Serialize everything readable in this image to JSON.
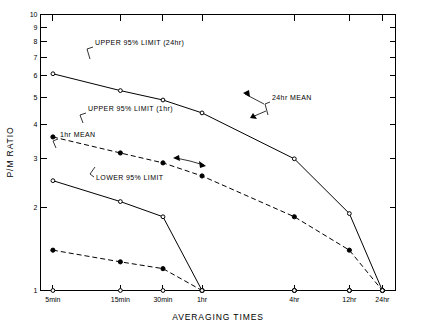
{
  "chart_data": {
    "type": "line",
    "title": "",
    "xlabel": "AVERAGING TIMES",
    "ylabel": "P/M RATIO",
    "yscale": "log",
    "ylim": [
      1,
      10
    ],
    "grid": false,
    "legend_position": "inline-annotations",
    "categories": [
      "5min",
      "15min",
      "30min",
      "1hr",
      "4hr",
      "12hr",
      "24hr"
    ],
    "x_tick_labels": [
      "5min",
      "15min",
      "30min",
      "1hr",
      "4hr",
      "12hr",
      "24hr"
    ],
    "y_tick_labels": [
      "1",
      "2",
      "3",
      "4",
      "5",
      "6",
      "7",
      "8",
      "9",
      "10"
    ],
    "y_tick_values": [
      1,
      2,
      3,
      4,
      5,
      6,
      7,
      8,
      9,
      10
    ],
    "series": [
      {
        "name": "UPPER 95% LIMIT (24hr)",
        "style": "solid",
        "marker": "open-circle",
        "values": [
          6.1,
          5.3,
          4.9,
          4.4,
          3.0,
          1.9,
          1.0
        ]
      },
      {
        "name": "24hr MEAN",
        "style": "dashed",
        "marker": "filled-circle",
        "values": [
          3.6,
          3.15,
          2.9,
          2.6,
          1.85,
          1.4,
          1.0
        ]
      },
      {
        "name": "UPPER 95% LIMIT (1hr)",
        "style": "solid",
        "marker": "open-circle",
        "values": [
          2.5,
          2.1,
          1.85,
          1.0,
          1.0,
          1.0,
          1.0
        ]
      },
      {
        "name": "1hr MEAN",
        "style": "dashed",
        "marker": "filled-circle",
        "values": [
          1.4,
          1.27,
          1.2,
          1.0,
          1.0,
          1.0,
          1.0
        ]
      },
      {
        "name": "LOWER 95% LIMIT",
        "style": "solid",
        "marker": "open-circle",
        "values": [
          1.0,
          1.0,
          1.0,
          1.0,
          1.0,
          1.0,
          1.0
        ]
      }
    ],
    "annotations": [
      {
        "id": "upper-95-24hr",
        "text": "UPPER 95% LIMIT (24hr)",
        "text_x": 95,
        "text_y": 45,
        "leader": "M 93 47 L 87 49 L 90 59"
      },
      {
        "id": "24hr-mean",
        "text": "24hr MEAN",
        "text_x": 272,
        "text_y": 100,
        "leader": "M 270 102 L 265 104 L 268 115"
      },
      {
        "id": "upper-95-1hr",
        "text": "UPPER 95% LIMIT (1hr)",
        "text_x": 88,
        "text_y": 111,
        "leader": "M 86 113 L 80 115 L 83 123"
      },
      {
        "id": "1hr-mean",
        "text": "1hr MEAN",
        "text_x": 60,
        "text_y": 137,
        "leader": "M 58 139 L 53 141 L 56 148"
      },
      {
        "id": "lower-95",
        "text": "LOWER 95% LIMIT",
        "text_x": 96,
        "text_y": 180,
        "leader": "M 94 177 L 90 174 L 95 167"
      }
    ],
    "arrows": [
      {
        "id": "arrow-24hr-mean-to-upper",
        "path": "M 264 104 L 245 94",
        "head": "250,97 243,93 249,90"
      },
      {
        "id": "arrow-24hr-mean-to-mean",
        "path": "M 266 111 L 252 117",
        "head": "253,113 250,118 257,119"
      },
      {
        "id": "arrow-lower-to-line",
        "path": "M 190 161 L 176 158",
        "head": "179,155 173,158 180,161"
      },
      {
        "id": "arrow-lower-to-24hr",
        "path": "M 190 161 L 204 165",
        "head": "199,161 206,166 200,168"
      }
    ]
  }
}
